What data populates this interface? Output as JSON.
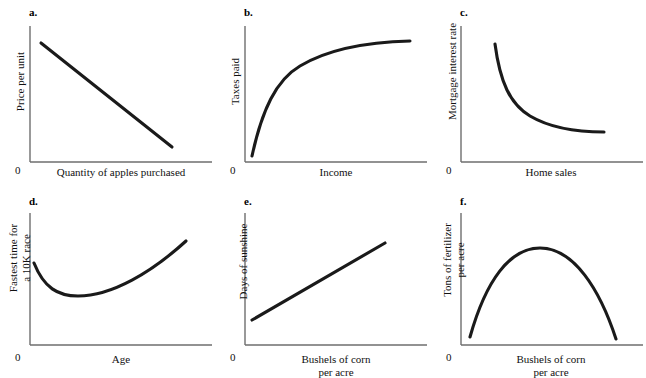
{
  "figure": {
    "background_color": "#ffffff",
    "axis_color": "#6e6e6e",
    "curve_color": "#1a1a1a",
    "zero_label": "0"
  },
  "chart_data": [
    {
      "type": "line",
      "panel": "a",
      "letter": "a.",
      "title": "",
      "xlabel": "Quantity of apples purchased",
      "ylabel": "Price per unit",
      "relationship": "negative linear",
      "grid": false,
      "legend": "none",
      "xlim": [
        0,
        100
      ],
      "ylim": [
        0,
        100
      ],
      "x": [
        8,
        22,
        36,
        50,
        64,
        78,
        92
      ],
      "y": [
        88,
        78,
        68,
        58,
        48,
        38,
        28
      ],
      "path": "M 41 43 L 172 147"
    },
    {
      "type": "line",
      "panel": "b",
      "letter": "b.",
      "title": "",
      "xlabel": "Income",
      "ylabel": "Taxes paid",
      "relationship": "positive, diminishing returns (concave)",
      "grid": false,
      "legend": "none",
      "xlim": [
        0,
        100
      ],
      "ylim": [
        0,
        100
      ],
      "x": [
        4,
        12,
        22,
        34,
        48,
        62,
        76,
        90
      ],
      "y": [
        4,
        34,
        56,
        70,
        79,
        84,
        86,
        87
      ],
      "path": "M 252 156 C 262 110, 276 80, 300 66 C 330 48, 370 42, 410 41"
    },
    {
      "type": "line",
      "panel": "c",
      "letter": "c.",
      "title": "",
      "xlabel": "Home sales",
      "ylabel": "Mortgage interest rate",
      "relationship": "negative, convex (decaying)",
      "grid": false,
      "legend": "none",
      "xlim": [
        0,
        100
      ],
      "ylim": [
        0,
        100
      ],
      "x": [
        10,
        18,
        28,
        40,
        54,
        70,
        86
      ],
      "y": [
        90,
        66,
        48,
        36,
        29,
        25,
        24
      ],
      "path": "M 495 44 C 500 82, 510 104, 530 116 C 552 129, 580 132, 604 132"
    },
    {
      "type": "line",
      "panel": "d",
      "letter": "d.",
      "title": "",
      "xlabel": "Age",
      "ylabel": "Fastest time for\na 10K race",
      "relationship": "U-shaped (minimum in middle-left)",
      "grid": false,
      "legend": "none",
      "xlim": [
        0,
        100
      ],
      "ylim": [
        0,
        100
      ],
      "x": [
        6,
        16,
        28,
        42,
        56,
        72,
        88
      ],
      "y": [
        60,
        46,
        41,
        44,
        52,
        63,
        76
      ],
      "path": "M 34 263 C 44 288, 58 296, 78 296 C 112 296, 152 272, 186 241"
    },
    {
      "type": "line",
      "panel": "e",
      "letter": "e.",
      "title": "",
      "xlabel": "Bushels of corn\nper acre",
      "ylabel": "Days of sunshine",
      "relationship": "positive linear",
      "grid": false,
      "legend": "none",
      "xlim": [
        0,
        100
      ],
      "ylim": [
        0,
        100
      ],
      "x": [
        8,
        22,
        36,
        50,
        64,
        78,
        92
      ],
      "y": [
        22,
        32,
        42,
        52,
        62,
        72,
        82
      ],
      "path": "M 252 320 L 385 243"
    },
    {
      "type": "line",
      "panel": "f",
      "letter": "f.",
      "title": "",
      "xlabel": "Bushels of corn\nper acre",
      "ylabel": "Tons of fertilizer\nper acre",
      "relationship": "inverted U (concave parabola, peak near middle)",
      "grid": false,
      "legend": "none",
      "xlim": [
        0,
        100
      ],
      "ylim": [
        0,
        100
      ],
      "x": [
        8,
        20,
        34,
        48,
        60,
        74,
        88
      ],
      "y": [
        6,
        48,
        72,
        80,
        76,
        54,
        8
      ],
      "path": "M 470 337 C 486 280, 510 248, 540 248 C 574 248, 600 290, 616 339"
    }
  ]
}
